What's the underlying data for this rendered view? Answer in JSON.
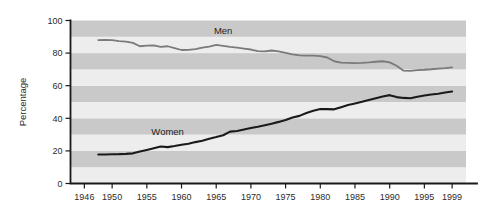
{
  "chart_data": {
    "type": "line",
    "title": "",
    "subtitle": "",
    "xlabel": "",
    "ylabel": "Percentage",
    "xlim": [
      1944,
      2001
    ],
    "ylim": [
      0,
      100
    ],
    "grid": "horizontal-bands",
    "band_interval": 10,
    "legend_position": "inline-annotation",
    "x_ticks": [
      1946,
      1950,
      1955,
      1960,
      1965,
      1970,
      1975,
      1980,
      1985,
      1990,
      1995,
      1999
    ],
    "x_tick_labels": [
      "1946",
      "1950",
      "1955",
      "1960",
      "1965",
      "1970",
      "1975",
      "1980",
      "1985",
      "1990",
      "1995",
      "1999"
    ],
    "y_ticks": [
      0,
      20,
      40,
      60,
      80,
      100
    ],
    "y_tick_labels": [
      "0",
      "20",
      "40",
      "60",
      "80",
      "100"
    ],
    "series": [
      {
        "name": "Men",
        "label": "Men",
        "color": "#7a7a7a",
        "stroke_width": 1.8,
        "x": [
          1948,
          1949,
          1950,
          1951,
          1952,
          1953,
          1954,
          1955,
          1956,
          1957,
          1958,
          1959,
          1960,
          1961,
          1962,
          1963,
          1964,
          1965,
          1966,
          1967,
          1968,
          1969,
          1970,
          1971,
          1972,
          1973,
          1974,
          1975,
          1976,
          1977,
          1978,
          1979,
          1980,
          1981,
          1982,
          1983,
          1984,
          1985,
          1986,
          1987,
          1988,
          1989,
          1990,
          1991,
          1992,
          1993,
          1994,
          1995,
          1996,
          1997,
          1998,
          1999
        ],
        "values": [
          88.0,
          88.1,
          88.0,
          87.4,
          87.1,
          86.3,
          84.2,
          84.6,
          84.7,
          83.8,
          84.2,
          83.1,
          81.9,
          82.0,
          82.4,
          83.3,
          84.0,
          85.0,
          84.5,
          83.8,
          83.3,
          82.8,
          82.2,
          81.2,
          81.0,
          81.6,
          81.0,
          80.2,
          79.2,
          78.6,
          78.4,
          78.4,
          78.1,
          77.3,
          75.0,
          74.2,
          74.0,
          73.8,
          74.0,
          74.3,
          74.7,
          75.0,
          74.3,
          72.2,
          69.2,
          69.1,
          69.6,
          69.8,
          70.1,
          70.5,
          70.8,
          71.3
        ]
      },
      {
        "name": "Women",
        "label": "Women",
        "color": "#1a1a1a",
        "stroke_width": 2.1,
        "x": [
          1948,
          1949,
          1950,
          1951,
          1952,
          1953,
          1954,
          1955,
          1956,
          1957,
          1958,
          1959,
          1960,
          1961,
          1962,
          1963,
          1964,
          1965,
          1966,
          1967,
          1968,
          1969,
          1970,
          1971,
          1972,
          1973,
          1974,
          1975,
          1976,
          1977,
          1978,
          1979,
          1980,
          1981,
          1982,
          1983,
          1984,
          1985,
          1986,
          1987,
          1988,
          1989,
          1990,
          1991,
          1992,
          1993,
          1994,
          1995,
          1996,
          1997,
          1998,
          1999
        ],
        "values": [
          17.8,
          17.8,
          17.9,
          18.0,
          18.2,
          18.5,
          19.6,
          20.6,
          21.6,
          22.7,
          22.3,
          23.0,
          23.8,
          24.4,
          25.4,
          26.2,
          27.5,
          28.5,
          29.6,
          31.8,
          32.2,
          33.1,
          34.0,
          34.8,
          35.7,
          36.7,
          37.8,
          39.0,
          40.5,
          41.5,
          43.2,
          44.6,
          45.7,
          45.6,
          45.5,
          46.8,
          48.1,
          49.1,
          50.1,
          51.2,
          52.3,
          53.4,
          54.2,
          53.0,
          52.5,
          52.3,
          53.2,
          54.0,
          54.6,
          55.1,
          55.8,
          56.4
        ]
      }
    ],
    "annotations": [
      {
        "text": "Men",
        "x_year": 1966,
        "y_value": 92.0
      },
      {
        "text": "Women",
        "x_year": 1958,
        "y_value": 30.0
      }
    ],
    "band_colors": {
      "light": "#ededed",
      "dark": "#c9c9c9"
    }
  }
}
